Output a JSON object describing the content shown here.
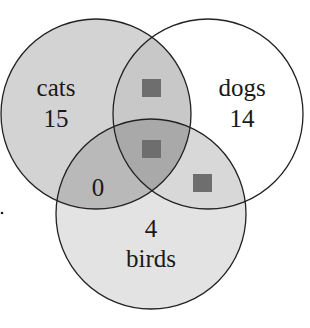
{
  "diagram": {
    "type": "venn",
    "sets": [
      {
        "name": "cats",
        "label": "cats",
        "count": "15",
        "fill": "#d3d3d3"
      },
      {
        "name": "dogs",
        "label": "dogs",
        "count": "14",
        "fill": "#ffffff"
      },
      {
        "name": "birds",
        "label": "birds",
        "count": "4",
        "fill": "#e3e3e3"
      }
    ],
    "regions": {
      "cats_birds_only": "0",
      "cats_dogs_only": "unknown",
      "all_three": "unknown",
      "dogs_birds_only": "unknown"
    },
    "colors": {
      "outline": "#222222",
      "cats_dogs": "#c8c8c8",
      "cats_birds": "#b9b9b9",
      "dogs_birds": "#d8d8d8",
      "center": "#a9a9a9",
      "placeholder_square": "#6e6e6e"
    }
  }
}
